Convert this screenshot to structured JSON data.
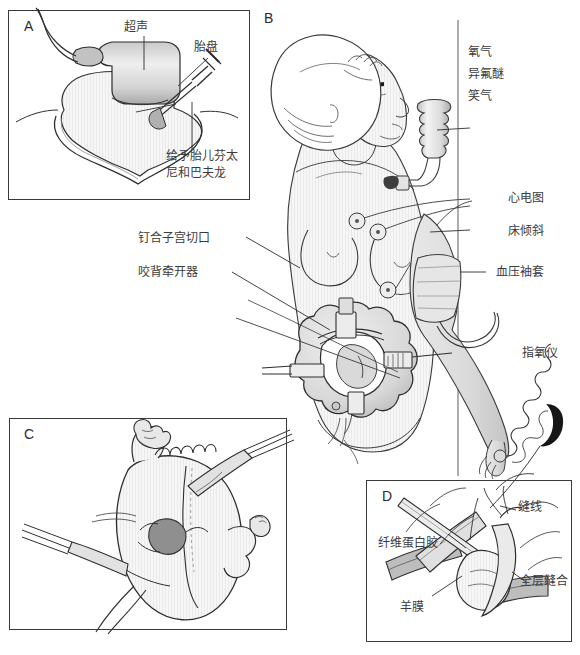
{
  "figure": {
    "width": 580,
    "height": 655,
    "panels": [
      {
        "id": "A",
        "letter": "A"
      },
      {
        "id": "B",
        "letter": "B"
      },
      {
        "id": "C",
        "letter": "C"
      },
      {
        "id": "D",
        "letter": "D"
      }
    ]
  },
  "panel_a": {
    "letter": "A",
    "labels": {
      "ultrasound": "超声",
      "placenta": "胎盘",
      "fetal_drugs_line1": "给予胎儿芬太",
      "fetal_drugs_line2": "尼和巴夫龙"
    }
  },
  "panel_b": {
    "letter": "B",
    "labels": {
      "oxygen": "氧气",
      "isoflurane": "异氟醚",
      "nitrous_oxide": "笑气",
      "ecg": "心电图",
      "bed_tilt": "床倾斜",
      "bp_cuff": "血压袖套",
      "pulse_oximeter": "指氧仪",
      "uterine_stapler": "钉合子宫切口",
      "retractor": "咬背牵开器"
    }
  },
  "panel_c": {
    "letter": "C",
    "labels": {}
  },
  "panel_d": {
    "letter": "D",
    "labels": {
      "suture": "缝线",
      "fibrin_glue": "纤维蛋白胶",
      "full_thickness_closure": "全层缝合",
      "amnion": "羊膜"
    }
  },
  "colors": {
    "ink": "#2b2b2b",
    "stroke": "#3a3a3a",
    "label_text": "#3b3b3b",
    "skin_light": "#f2f2f2",
    "skin_mid": "#e2e2e2",
    "skin_shadow": "#cfcfcf",
    "organ_dark": "#9c9c9c",
    "background": "#ffffff"
  }
}
